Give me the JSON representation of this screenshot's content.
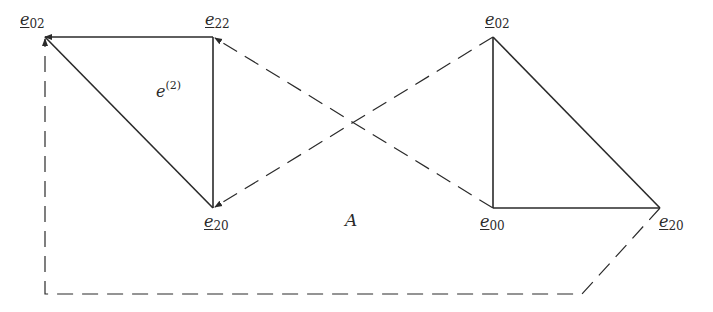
{
  "diagram": {
    "vertices": [
      {
        "id": "left-e02",
        "base": "e",
        "sub": "02",
        "x": 45,
        "y": 37
      },
      {
        "id": "left-e22",
        "base": "e",
        "sub": "22",
        "x": 213,
        "y": 37
      },
      {
        "id": "left-e20",
        "base": "e",
        "sub": "20",
        "x": 213,
        "y": 208
      },
      {
        "id": "right-e02",
        "base": "e",
        "sub": "02",
        "x": 493,
        "y": 37
      },
      {
        "id": "right-e00",
        "base": "e",
        "sub": "00",
        "x": 493,
        "y": 208
      },
      {
        "id": "right-e20",
        "base": "e",
        "sub": "20",
        "x": 660,
        "y": 208
      }
    ],
    "labels": {
      "left_e02": {
        "base": "e",
        "sub": "02"
      },
      "left_e22": {
        "base": "e",
        "sub": "22"
      },
      "left_e20": {
        "base": "e",
        "sub": "20"
      },
      "right_e02": {
        "base": "e",
        "sub": "02"
      },
      "right_e00": {
        "base": "e",
        "sub": "00"
      },
      "right_e20": {
        "base": "e",
        "sub": "20"
      },
      "simplex": {
        "base": "e",
        "sup": "(2)"
      },
      "region": "A"
    },
    "solid_edges": [
      [
        "left-e22",
        "left-e02"
      ],
      [
        "left-e02",
        "left-e20"
      ],
      [
        "left-e22",
        "left-e20"
      ],
      [
        "right-e02",
        "right-e00"
      ],
      [
        "right-e00",
        "right-e20"
      ],
      [
        "right-e02",
        "right-e20"
      ]
    ],
    "dashed_edges": [
      {
        "from": "right-e00",
        "to": "left-e22",
        "arrow": "end"
      },
      {
        "from": "right-e02",
        "to": "left-e20",
        "arrow": "end"
      },
      {
        "path": [
          "right-e20",
          [
            582,
            294
          ],
          [
            45,
            294
          ],
          "left-e02"
        ],
        "arrow": "end"
      }
    ],
    "colors": {
      "stroke": "#2a2a2a",
      "background": "#ffffff"
    }
  }
}
